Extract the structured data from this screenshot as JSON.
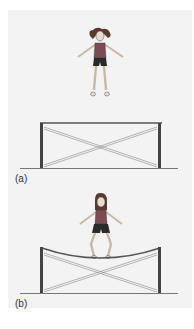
{
  "figure": {
    "panels": [
      {
        "label": "(a)",
        "description": "girl in the air above an unstretched trampoline"
      },
      {
        "label": "(b)",
        "description": "girl standing on a stretched, sagging trampoline"
      }
    ]
  },
  "colors": {
    "background": "#f3f3f3",
    "frame": "#555555",
    "post": "#444444",
    "ground": "#777777",
    "shirt": "#7a4d55",
    "shorts": "#2a2a2a",
    "hair": "#5a3a30",
    "skin": "#e8dcd0"
  }
}
